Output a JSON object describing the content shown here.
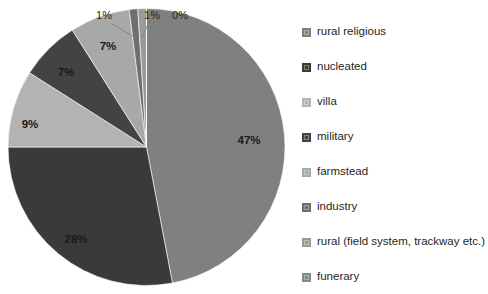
{
  "chart_data": {
    "type": "pie",
    "title": "",
    "subtitle": "",
    "xlabel": "",
    "ylabel": "",
    "grid": false,
    "legend_position": "right",
    "start_angle_deg": 0,
    "direction": "clockwise",
    "categories": [
      "rural religious",
      "nucleated",
      "villa",
      "military",
      "farmstead",
      "industry",
      "rural (field system, trackway etc.)",
      "funerary"
    ],
    "values": [
      47,
      28,
      9,
      7,
      7,
      1,
      1,
      0
    ],
    "data_labels": [
      "47%",
      "28%",
      "9%",
      "7%",
      "7%",
      "1%",
      "1%",
      "0%"
    ],
    "colors": [
      "#808080",
      "#3a3a3a",
      "#b3b3b3",
      "#434343",
      "#a8a8a8",
      "#6e6e6e",
      "#9a9a9a",
      "#878787"
    ],
    "annotations": [
      {
        "text": "1%",
        "leader": true,
        "category": "industry"
      },
      {
        "text": "1%",
        "leader": true,
        "category": "rural (field system, trackway etc.)"
      },
      {
        "text": "0%",
        "leader": true,
        "category": "funerary"
      }
    ]
  },
  "legend": {
    "items": [
      {
        "label": "rural religious",
        "color": "#808080"
      },
      {
        "label": "nucleated",
        "color": "#3a3a3a"
      },
      {
        "label": "villa",
        "color": "#b3b3b3"
      },
      {
        "label": "military",
        "color": "#434343"
      },
      {
        "label": "farmstead",
        "color": "#a8a8a8"
      },
      {
        "label": "industry",
        "color": "#6e6e6e"
      },
      {
        "label": "rural (field system, trackway etc.)",
        "color": "#9a9a9a"
      },
      {
        "label": "funerary",
        "color": "#878787"
      }
    ]
  },
  "inner_labels": [
    {
      "text": "47%",
      "x": 249,
      "y": 144
    },
    {
      "text": "28%",
      "x": 76,
      "y": 243
    },
    {
      "text": "9%",
      "x": 30,
      "y": 128
    },
    {
      "text": "7%",
      "x": 66,
      "y": 76
    },
    {
      "text": "7%",
      "x": 108,
      "y": 50
    }
  ],
  "callout_labels": [
    {
      "text": "1%",
      "x": 104,
      "y": 19
    },
    {
      "text": "1%",
      "x": 152,
      "y": 19
    },
    {
      "text": "0%",
      "x": 180,
      "y": 19
    }
  ]
}
